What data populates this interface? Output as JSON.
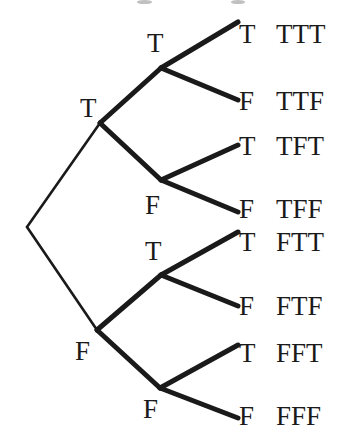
{
  "figure": {
    "name": "binary-truth-tree",
    "width": 341,
    "height": 445,
    "background_color": "#ffffff",
    "line_color": "#1a1a1a",
    "text_color": "#1a1a1a"
  },
  "nodes": [
    {
      "id": "root",
      "label": "",
      "x": 27,
      "y": 227
    },
    {
      "id": "T",
      "label": "T",
      "x": 100,
      "y": 123,
      "label_x": 80,
      "label_y": 95
    },
    {
      "id": "F",
      "label": "F",
      "x": 97,
      "y": 330,
      "label_x": 75,
      "label_y": 338
    },
    {
      "id": "TT",
      "label": "T",
      "x": 161,
      "y": 68,
      "label_x": 147,
      "label_y": 30
    },
    {
      "id": "TF",
      "label": "F",
      "x": 161,
      "y": 180,
      "label_x": 145,
      "label_y": 192
    },
    {
      "id": "FT",
      "label": "T",
      "x": 161,
      "y": 275,
      "label_x": 145,
      "label_y": 238
    },
    {
      "id": "FF",
      "label": "F",
      "x": 160,
      "y": 388,
      "label_x": 143,
      "label_y": 396
    }
  ],
  "edges": [
    {
      "from": "root",
      "to": "T",
      "width": 2.6
    },
    {
      "from": "root",
      "to": "F",
      "width": 2.6
    },
    {
      "from": "T",
      "to": "TT",
      "width": 5.0
    },
    {
      "from": "T",
      "to": "TF",
      "width": 5.0
    },
    {
      "from": "F",
      "to": "FT",
      "width": 5.0
    },
    {
      "from": "F",
      "to": "FF",
      "width": 5.0
    },
    {
      "from": "TT",
      "to": "L1",
      "width": 5.0
    },
    {
      "from": "TT",
      "to": "L2",
      "width": 5.0
    },
    {
      "from": "TF",
      "to": "L3",
      "width": 5.0
    },
    {
      "from": "TF",
      "to": "L4",
      "width": 5.0
    },
    {
      "from": "FT",
      "to": "L5",
      "width": 5.0
    },
    {
      "from": "FT",
      "to": "L6",
      "width": 5.0
    },
    {
      "from": "FF",
      "to": "L7",
      "width": 5.0
    },
    {
      "from": "FF",
      "to": "L8",
      "width": 5.0
    }
  ],
  "leaves": [
    {
      "id": "L1",
      "value": "T",
      "path": "TTT",
      "tip_x": 238,
      "tip_y": 22,
      "value_x": 239,
      "value_y": 21,
      "path_x": 276,
      "path_y": 21
    },
    {
      "id": "L2",
      "value": "F",
      "path": "TTF",
      "tip_x": 238,
      "tip_y": 100,
      "value_x": 239,
      "value_y": 88,
      "path_x": 276,
      "path_y": 88
    },
    {
      "id": "L3",
      "value": "T",
      "path": "TFT",
      "tip_x": 238,
      "tip_y": 145,
      "value_x": 239,
      "value_y": 133,
      "path_x": 276,
      "path_y": 133
    },
    {
      "id": "L4",
      "value": "F",
      "path": "TFF",
      "tip_x": 238,
      "tip_y": 212,
      "value_x": 239,
      "value_y": 196,
      "path_x": 276,
      "path_y": 196
    },
    {
      "id": "L5",
      "value": "T",
      "path": "FTT",
      "tip_x": 238,
      "tip_y": 232,
      "value_x": 239,
      "value_y": 229,
      "path_x": 276,
      "path_y": 229
    },
    {
      "id": "L6",
      "value": "F",
      "path": "FTF",
      "tip_x": 238,
      "tip_y": 306,
      "value_x": 239,
      "value_y": 293,
      "path_x": 276,
      "path_y": 293
    },
    {
      "id": "L7",
      "value": "T",
      "path": "FFT",
      "tip_x": 238,
      "tip_y": 345,
      "value_x": 239,
      "value_y": 340,
      "path_x": 276,
      "path_y": 340
    },
    {
      "id": "L8",
      "value": "F",
      "path": "FFF",
      "tip_x": 238,
      "tip_y": 418,
      "value_x": 239,
      "value_y": 403,
      "path_x": 276,
      "path_y": 403
    }
  ],
  "artifacts": [
    {
      "id": "A1",
      "x": 137,
      "y": 0,
      "width": 15,
      "height": 4
    },
    {
      "id": "A2",
      "x": 231,
      "y": 0,
      "width": 14,
      "height": 4
    }
  ]
}
